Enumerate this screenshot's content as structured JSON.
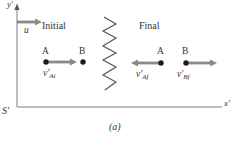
{
  "figure": {
    "caption": "(a)",
    "axes": {
      "x_label": "x′",
      "y_label": "y′",
      "frame_label": "S′"
    },
    "frame_arrow": {
      "label": "u"
    },
    "sections": {
      "initial": {
        "title": "Initial",
        "particle_a": "A",
        "particle_b": "B",
        "velocity_a": {
          "base": "v′",
          "sub": "Ai"
        }
      },
      "final": {
        "title": "Final",
        "particle_a": "A",
        "particle_b": "B",
        "velocity_a": {
          "base": "v′",
          "sub": "Af"
        },
        "velocity_b": {
          "base": "v′",
          "sub": "Bf"
        }
      }
    },
    "colors": {
      "arrow": "#8a8a8a",
      "axis": "#808080",
      "zigzag": "#555555",
      "dot": "#1a1a1a",
      "text": "#333333"
    }
  }
}
